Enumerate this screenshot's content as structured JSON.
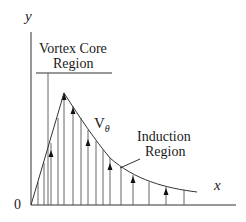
{
  "diagram": {
    "axes": {
      "y_label": "y",
      "x_label": "x",
      "origin_label": "0"
    },
    "regions": {
      "vortex_core": {
        "line1": "Vortex Core",
        "line2": "Region"
      },
      "induction": {
        "line1": "Induction",
        "line2": "Region"
      }
    },
    "curve_label": {
      "main": "V",
      "subscript": "θ"
    },
    "colors": {
      "line": "#333333",
      "text": "#1a1a1a",
      "background": "#ffffff"
    }
  }
}
